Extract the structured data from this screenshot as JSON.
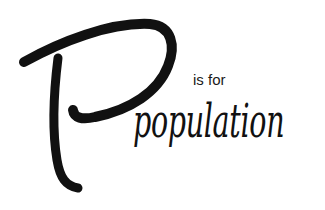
{
  "graphic": {
    "letter": "P",
    "connector": "is for",
    "word": "population",
    "ink_color": "#111111",
    "background": "#ffffff"
  }
}
